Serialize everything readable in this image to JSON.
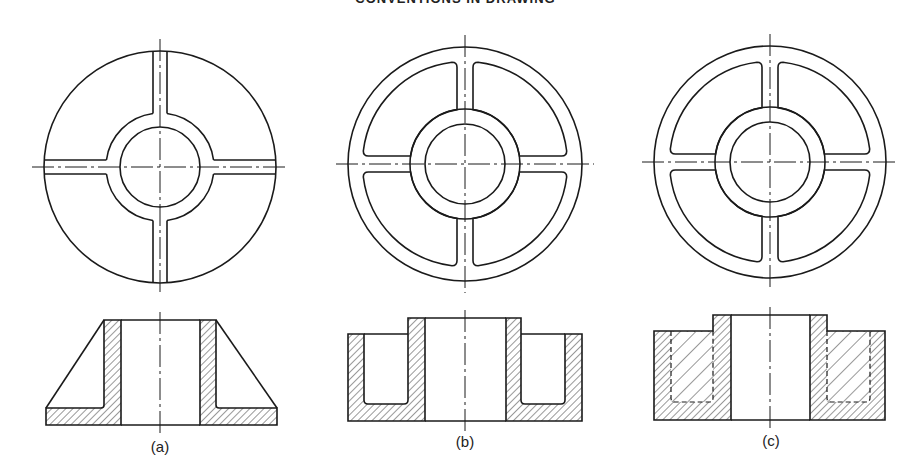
{
  "header": {
    "title": "CONVENTIONS IN DRAWING"
  },
  "style": {
    "line_color": "#1a1a1a",
    "hatch_color": "#333333",
    "background": "#ffffff"
  },
  "figures": [
    {
      "id": "a",
      "label": "(a)",
      "plan": {
        "cx": 160,
        "cy": 167,
        "outer_r": 116,
        "rim_inner_r": null,
        "hub_r": 54,
        "bore_r": 40,
        "spoke_half_width": 7,
        "style": "solid-web"
      },
      "section": {
        "type": "tapered",
        "top": 320,
        "base_top": 408,
        "bottom": 425,
        "left": 46,
        "right": 277,
        "hub_left": 104,
        "bore_left": 121,
        "bore_right": 200,
        "hub_right": 216
      },
      "label_pos": {
        "x": 160,
        "y": 452
      }
    },
    {
      "id": "b",
      "label": "(b)",
      "plan": {
        "cx": 465,
        "cy": 164,
        "outer_r": 117,
        "rim_inner_r": 102,
        "hub_r": 55,
        "bore_r": 40,
        "spoke_half_width": 8,
        "style": "ribbed"
      },
      "section": {
        "type": "pocketed",
        "top": 318,
        "rim_top": 334,
        "pocket_bottom": 404,
        "bottom": 421,
        "left": 348,
        "rim_left_inner": 364,
        "hub_left": 408,
        "bore_left": 425,
        "bore_right": 506,
        "hub_right": 521,
        "rim_right_inner": 565,
        "right": 582
      },
      "label_pos": {
        "x": 465,
        "y": 447
      }
    },
    {
      "id": "c",
      "label": "(c)",
      "plan": {
        "cx": 770,
        "cy": 162,
        "outer_r": 116,
        "rim_inner_r": 100,
        "hub_r": 55,
        "bore_r": 40,
        "spoke_half_width": 8,
        "style": "ribbed"
      },
      "section": {
        "type": "hidden-pocket",
        "top": 315,
        "rim_top": 331,
        "pocket_bottom": 402,
        "bottom": 420,
        "left": 654,
        "pocket_left": 671,
        "hub_left": 713,
        "bore_left": 731,
        "bore_right": 810,
        "hub_right": 827,
        "pocket_right": 870,
        "right": 885
      },
      "label_pos": {
        "x": 771,
        "y": 446
      }
    }
  ]
}
